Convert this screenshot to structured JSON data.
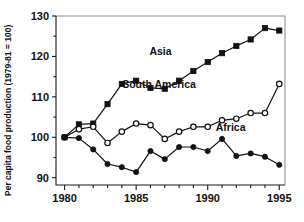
{
  "chart_data": {
    "type": "line",
    "title": "",
    "subtitle": "",
    "xlabel": "",
    "ylabel": "Per capita food production (1979-81 = 100)",
    "xlim": [
      1979.4,
      1995.4
    ],
    "ylim": [
      88.2,
      130
    ],
    "grid": false,
    "legend_position": "inline-annotations",
    "x_ticks_major": [
      1980,
      1985,
      1990,
      1995
    ],
    "x_tick_labels": [
      "1980",
      "1985",
      "1990",
      "1995"
    ],
    "x_ticks_minor": [
      1981,
      1982,
      1983,
      1984,
      1986,
      1987,
      1988,
      1989,
      1991,
      1992,
      1993,
      1994
    ],
    "y_ticks_major": [
      90,
      100,
      110,
      120,
      130
    ],
    "y_tick_labels": [
      "90",
      "100",
      "110",
      "120",
      "130"
    ],
    "y_ticks_minor": [
      95,
      105,
      115,
      125
    ],
    "x": [
      1980,
      1981,
      1982,
      1983,
      1984,
      1985,
      1986,
      1987,
      1988,
      1989,
      1990,
      1991,
      1992,
      1993,
      1994,
      1995
    ],
    "series": [
      {
        "name": "Asia",
        "marker": "filled-square",
        "values": [
          100.0,
          103.2,
          103.4,
          108.2,
          113.2,
          114.0,
          112.2,
          112.0,
          114.0,
          116.4,
          118.6,
          120.8,
          122.6,
          124.2,
          127.0,
          126.4
        ]
      },
      {
        "name": "South America",
        "marker": "open-circle",
        "values": [
          100.0,
          102.0,
          102.6,
          98.6,
          101.4,
          103.4,
          103.0,
          99.6,
          101.4,
          102.6,
          102.6,
          104.2,
          104.6,
          106.0,
          106.0,
          113.2
        ]
      },
      {
        "name": "Africa",
        "marker": "filled-circle",
        "values": [
          100.0,
          99.8,
          97.0,
          93.4,
          92.6,
          91.4,
          96.6,
          94.6,
          97.6,
          97.6,
          96.6,
          99.6,
          95.4,
          96.0,
          95.2,
          93.2
        ]
      }
    ],
    "annotations": [
      {
        "text": "Asia",
        "x": 1986.7,
        "y": 120.4
      },
      {
        "text": "South America",
        "x": 1986.6,
        "y": 112.3
      },
      {
        "text": "Africa",
        "x": 1991.6,
        "y": 101.6
      }
    ]
  },
  "axis": {
    "y_title": "Per capita food production (1979-81 = 100)"
  },
  "colors": {
    "line": "#111111",
    "axis": "#1a1a1a",
    "frame": "#8a8a8a",
    "background": "#ffffff"
  }
}
